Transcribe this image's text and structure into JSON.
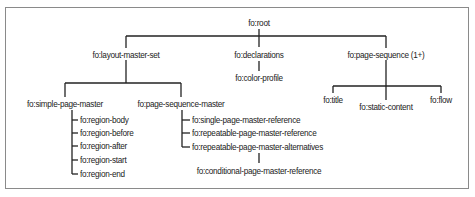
{
  "diagram": {
    "root": "fo:root",
    "level1": {
      "layout_master_set": "fo:layout-master-set",
      "declarations": "fo:declarations",
      "page_sequence": "fo:page-sequence (1+)"
    },
    "declarations_children": {
      "color_profile": "fo:color-profile"
    },
    "layout_children": {
      "simple_page_master": "fo:simple-page-master",
      "page_sequence_master": "fo:page-sequence-master"
    },
    "simple_page_master_children": [
      "fo:region-body",
      "fo:region-before",
      "fo:region-after",
      "fo:region-start",
      "fo:region-end"
    ],
    "page_sequence_master_children": [
      "fo:single-page-master-reference",
      "fo:repeatable-page-master-reference",
      "fo:repeatable-page-master-alternatives"
    ],
    "alternatives_child": "fo:conditional-page-master-reference",
    "page_sequence_children": {
      "title": "fo:title",
      "static_content": "fo:static-content",
      "flow": "fo:flow"
    }
  }
}
